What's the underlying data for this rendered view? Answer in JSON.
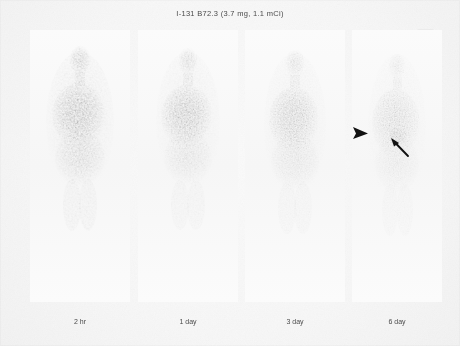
{
  "figure": {
    "title": "I-131 B72.3 (3.7 mg, 1.1 mCi)",
    "modality": "planar whole-body scintigraphy",
    "view": "anterior",
    "corner_mark": "film-corner-marker"
  },
  "panels": [
    {
      "id": "panel-2hr",
      "label": "2 hr",
      "timepoint_hours": 2,
      "uptake_intensity": 1.0,
      "description": "blood-pool activity, intense thoracic and cardiac uptake"
    },
    {
      "id": "panel-1day",
      "label": "1 day",
      "timepoint_hours": 24,
      "uptake_intensity": 0.85,
      "description": "persistent central thoracic activity, reduced soft tissue background"
    },
    {
      "id": "panel-3day",
      "label": "3 day",
      "timepoint_hours": 72,
      "uptake_intensity": 0.6,
      "description": "decreasing blood-pool, residual mediastinal and abdominal activity"
    },
    {
      "id": "panel-6day",
      "label": "6 day",
      "timepoint_hours": 144,
      "uptake_intensity": 0.38,
      "description": "faint residual activity with focal tumor localization"
    }
  ],
  "annotations": [
    {
      "id": "arrowhead-lesion",
      "type": "arrowhead",
      "icon": "solid-triangle-arrowhead-icon",
      "panel": "panel-6day",
      "points": "right",
      "x": 356,
      "y": 131
    },
    {
      "id": "arrow-lesion",
      "type": "arrow",
      "icon": "line-arrow-icon",
      "panel": "panel-6day",
      "points": "up-left",
      "x": 390,
      "y": 140
    }
  ],
  "colors": {
    "background": "#fcfcfc",
    "film": "#f7f7f7",
    "text": "#4a4a4a",
    "annotation": "#111111",
    "uptake": "#1a1a1a"
  }
}
